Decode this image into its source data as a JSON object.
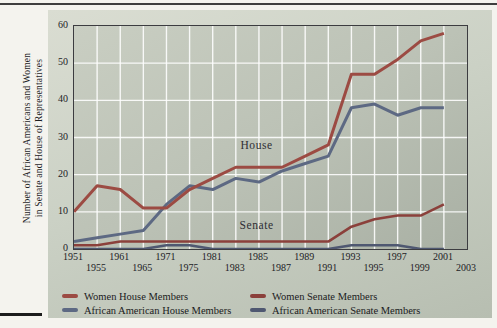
{
  "page": {
    "background_color": "#f4f3ee"
  },
  "chart_data": {
    "type": "line",
    "ylabel_line1": "Number of African Americans and Women",
    "ylabel_line2": "in Senate and House of Representatives",
    "categories": [
      "1951",
      "1955",
      "1961",
      "1965",
      "1971",
      "1975",
      "1981",
      "1983",
      "1985",
      "1987",
      "1989",
      "1991",
      "1993",
      "1995",
      "1997",
      "1999",
      "2001",
      "2003"
    ],
    "ylim": [
      0,
      60
    ],
    "yticks": [
      0,
      10,
      20,
      30,
      40,
      50,
      60
    ],
    "grid": "white gridlines, vertical at every year tick, horizontal every 10",
    "legend_position": "bottom, two columns",
    "annotations": [
      {
        "text": "House",
        "x_index": 7.9,
        "value": 27
      },
      {
        "text": "Senate",
        "x_index": 7.9,
        "value": 5.3
      }
    ],
    "series": [
      {
        "name": "Women House Members",
        "color": "#9c4b43",
        "width": 3,
        "values": [
          10,
          17,
          16,
          11,
          11,
          16,
          19,
          22,
          22,
          22,
          25,
          28,
          47,
          47,
          51,
          56,
          58,
          null
        ]
      },
      {
        "name": "African American House Members",
        "color": "#5d6983",
        "width": 3,
        "values": [
          2,
          3,
          4,
          5,
          12,
          17,
          16,
          19,
          18,
          21,
          23,
          25,
          38,
          39,
          36,
          38,
          38,
          null
        ]
      },
      {
        "name": "Women Senate Members",
        "color": "#8b403b",
        "width": 2.6,
        "values": [
          1,
          1,
          2,
          2,
          2,
          2,
          2,
          2,
          2,
          2,
          2,
          2,
          6,
          8,
          9,
          9,
          12,
          null
        ]
      },
      {
        "name": "African American Senate Members",
        "color": "#4f5871",
        "width": 2.6,
        "values": [
          0,
          0,
          0,
          0,
          1,
          1,
          0,
          0,
          0,
          0,
          0,
          0,
          1,
          1,
          1,
          0,
          0,
          null
        ]
      }
    ],
    "legend": {
      "columns": [
        [
          "Women House Members",
          "African American House Members"
        ],
        [
          "Women Senate Members",
          "African American Senate Members"
        ]
      ]
    }
  }
}
